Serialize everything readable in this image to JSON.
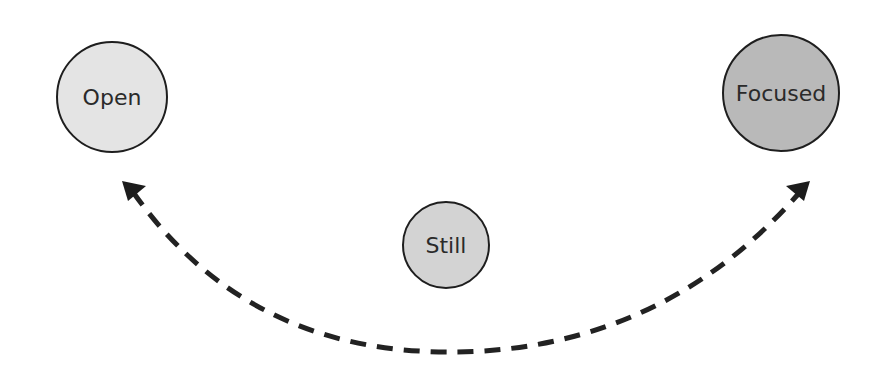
{
  "diagram": {
    "nodes": [
      {
        "id": "open",
        "label": "Open",
        "cx": 112,
        "cy": 97,
        "r": 55,
        "fill": "#e4e4e4"
      },
      {
        "id": "still",
        "label": "Still",
        "cx": 446,
        "cy": 245,
        "r": 43,
        "fill": "#d3d3d3"
      },
      {
        "id": "focused",
        "label": "Focused",
        "cx": 781,
        "cy": 93,
        "r": 58,
        "fill": "#b9b9b9"
      }
    ],
    "edge": {
      "style": "dashed",
      "direction": "bidirectional",
      "from": "open",
      "to": "focused",
      "color": "#222222"
    }
  }
}
